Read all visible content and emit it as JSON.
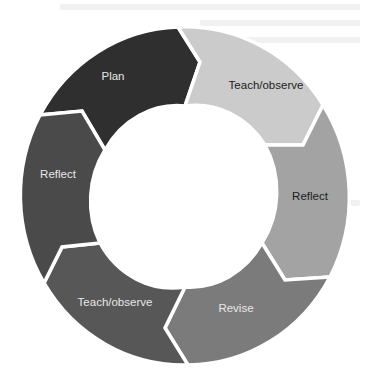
{
  "diagram": {
    "type": "cycle",
    "title": "",
    "steps": [
      {
        "label": "Plan",
        "fill": "#2f2f2f",
        "text_color": "#e6e6e6",
        "label_x": 113,
        "label_y": 77
      },
      {
        "label": "Teach/observe",
        "fill": "#cbcbcb",
        "text_color": "#1c1c1c",
        "label_x": 266,
        "label_y": 86
      },
      {
        "label": "Reflect",
        "fill": "#a3a3a3",
        "text_color": "#1c1c1c",
        "label_x": 310,
        "label_y": 197
      },
      {
        "label": "Revise",
        "fill": "#7b7b7b",
        "text_color": "#e8e8e8",
        "label_x": 236,
        "label_y": 309
      },
      {
        "label": "Teach/observe",
        "fill": "#575757",
        "text_color": "#e8e8e8",
        "label_x": 115,
        "label_y": 303
      },
      {
        "label": "Reflect",
        "fill": "#4a4a4a",
        "text_color": "#e8e8e8",
        "label_x": 58,
        "label_y": 175
      }
    ],
    "center_fill": "#ffffff",
    "separator_color": "#ffffff"
  }
}
